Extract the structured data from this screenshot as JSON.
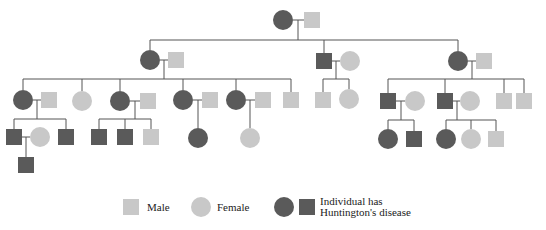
{
  "colors": {
    "affected": "#5a5a5a",
    "unaffected": "#c8c8c8",
    "line": "#555555",
    "background": "#ffffff"
  },
  "legend": {
    "male_label": "Male",
    "female_label": "Female",
    "affected_label_line1": "Individual has",
    "affected_label_line2": "Huntington's disease"
  },
  "individuals": [
    {
      "id": "g1-f",
      "gen": 1,
      "sex": "female",
      "affected": true,
      "x": 283,
      "y": 20
    },
    {
      "id": "g1-m",
      "gen": 1,
      "sex": "male",
      "affected": false,
      "x": 312,
      "y": 20
    },
    {
      "id": "g2-f1",
      "gen": 2,
      "sex": "female",
      "affected": true,
      "x": 150,
      "y": 60
    },
    {
      "id": "g2-m1",
      "gen": 2,
      "sex": "male",
      "affected": false,
      "x": 176,
      "y": 60
    },
    {
      "id": "g2-m2",
      "gen": 2,
      "sex": "male",
      "affected": true,
      "x": 324,
      "y": 61
    },
    {
      "id": "g2-f2",
      "gen": 2,
      "sex": "female",
      "affected": false,
      "x": 350,
      "y": 61
    },
    {
      "id": "g2-f3",
      "gen": 2,
      "sex": "female",
      "affected": true,
      "x": 458,
      "y": 61
    },
    {
      "id": "g2-m3",
      "gen": 2,
      "sex": "male",
      "affected": false,
      "x": 484,
      "y": 61
    },
    {
      "id": "g3-f1",
      "gen": 3,
      "sex": "female",
      "affected": true,
      "x": 23,
      "y": 100
    },
    {
      "id": "g3-m1",
      "gen": 3,
      "sex": "male",
      "affected": false,
      "x": 49,
      "y": 100
    },
    {
      "id": "g3-f2",
      "gen": 3,
      "sex": "female",
      "affected": false,
      "x": 82,
      "y": 101
    },
    {
      "id": "g3-f3",
      "gen": 3,
      "sex": "female",
      "affected": true,
      "x": 120,
      "y": 101
    },
    {
      "id": "g3-m3",
      "gen": 3,
      "sex": "male",
      "affected": false,
      "x": 148,
      "y": 101
    },
    {
      "id": "g3-f4",
      "gen": 3,
      "sex": "female",
      "affected": true,
      "x": 183,
      "y": 100
    },
    {
      "id": "g3-m4",
      "gen": 3,
      "sex": "male",
      "affected": false,
      "x": 210,
      "y": 100
    },
    {
      "id": "g3-f5",
      "gen": 3,
      "sex": "female",
      "affected": true,
      "x": 236,
      "y": 100
    },
    {
      "id": "g3-m5",
      "gen": 3,
      "sex": "male",
      "affected": false,
      "x": 263,
      "y": 100
    },
    {
      "id": "g3-m6",
      "gen": 3,
      "sex": "male",
      "affected": false,
      "x": 291,
      "y": 100
    },
    {
      "id": "g3-m7",
      "gen": 3,
      "sex": "male",
      "affected": false,
      "x": 323,
      "y": 100
    },
    {
      "id": "g3-f7",
      "gen": 3,
      "sex": "female",
      "affected": false,
      "x": 349,
      "y": 99
    },
    {
      "id": "g3-m8",
      "gen": 3,
      "sex": "male",
      "affected": true,
      "x": 388,
      "y": 101
    },
    {
      "id": "g3-f8",
      "gen": 3,
      "sex": "female",
      "affected": false,
      "x": 415,
      "y": 101
    },
    {
      "id": "g3-m9",
      "gen": 3,
      "sex": "male",
      "affected": true,
      "x": 445,
      "y": 101
    },
    {
      "id": "g3-f9",
      "gen": 3,
      "sex": "female",
      "affected": false,
      "x": 470,
      "y": 101
    },
    {
      "id": "g3-m10",
      "gen": 3,
      "sex": "male",
      "affected": false,
      "x": 504,
      "y": 101
    },
    {
      "id": "g3-m11",
      "gen": 3,
      "sex": "male",
      "affected": false,
      "x": 524,
      "y": 101
    },
    {
      "id": "g4-m1",
      "gen": 4,
      "sex": "male",
      "affected": true,
      "x": 14,
      "y": 137
    },
    {
      "id": "g4-f1",
      "gen": 4,
      "sex": "female",
      "affected": false,
      "x": 40,
      "y": 137
    },
    {
      "id": "g4-m2",
      "gen": 4,
      "sex": "male",
      "affected": true,
      "x": 66,
      "y": 137
    },
    {
      "id": "g4-m3",
      "gen": 4,
      "sex": "male",
      "affected": true,
      "x": 99,
      "y": 137
    },
    {
      "id": "g4-m4",
      "gen": 4,
      "sex": "male",
      "affected": true,
      "x": 125,
      "y": 137
    },
    {
      "id": "g4-m5",
      "gen": 4,
      "sex": "male",
      "affected": false,
      "x": 151,
      "y": 137
    },
    {
      "id": "g4-f6",
      "gen": 4,
      "sex": "female",
      "affected": true,
      "x": 198,
      "y": 138
    },
    {
      "id": "g4-f7",
      "gen": 4,
      "sex": "female",
      "affected": false,
      "x": 250,
      "y": 138
    },
    {
      "id": "g4-f8",
      "gen": 4,
      "sex": "female",
      "affected": true,
      "x": 388,
      "y": 139
    },
    {
      "id": "g4-m8",
      "gen": 4,
      "sex": "male",
      "affected": true,
      "x": 414,
      "y": 139
    },
    {
      "id": "g4-f9",
      "gen": 4,
      "sex": "female",
      "affected": true,
      "x": 446,
      "y": 139
    },
    {
      "id": "g4-f10",
      "gen": 4,
      "sex": "female",
      "affected": false,
      "x": 471,
      "y": 139
    },
    {
      "id": "g4-m10",
      "gen": 4,
      "sex": "male",
      "affected": false,
      "x": 496,
      "y": 139
    },
    {
      "id": "g5-m1",
      "gen": 5,
      "sex": "male",
      "affected": true,
      "x": 26,
      "y": 165
    }
  ],
  "lines": [
    [
      293,
      20,
      304,
      20
    ],
    [
      298,
      20,
      298,
      40
    ],
    [
      150,
      40,
      458,
      40
    ],
    [
      150,
      40,
      150,
      50
    ],
    [
      324,
      40,
      324,
      53
    ],
    [
      458,
      40,
      458,
      51
    ],
    [
      160,
      60,
      168,
      60
    ],
    [
      164,
      60,
      164,
      79
    ],
    [
      23,
      79,
      291,
      79
    ],
    [
      23,
      79,
      23,
      90
    ],
    [
      82,
      79,
      82,
      91
    ],
    [
      120,
      79,
      120,
      91
    ],
    [
      183,
      79,
      183,
      90
    ],
    [
      236,
      79,
      236,
      90
    ],
    [
      291,
      79,
      291,
      92
    ],
    [
      332,
      61,
      340,
      61
    ],
    [
      336,
      61,
      336,
      79
    ],
    [
      323,
      79,
      349,
      79
    ],
    [
      323,
      79,
      323,
      92
    ],
    [
      349,
      79,
      349,
      89
    ],
    [
      468,
      61,
      476,
      61
    ],
    [
      472,
      61,
      472,
      79
    ],
    [
      388,
      79,
      524,
      79
    ],
    [
      388,
      79,
      388,
      93
    ],
    [
      445,
      79,
      445,
      93
    ],
    [
      504,
      79,
      504,
      93
    ],
    [
      524,
      79,
      524,
      93
    ],
    [
      33,
      100,
      41,
      100
    ],
    [
      37,
      100,
      37,
      119
    ],
    [
      14,
      119,
      66,
      119
    ],
    [
      14,
      119,
      14,
      129
    ],
    [
      66,
      119,
      66,
      129
    ],
    [
      130,
      101,
      140,
      101
    ],
    [
      135,
      101,
      135,
      119
    ],
    [
      99,
      119,
      151,
      119
    ],
    [
      99,
      119,
      99,
      129
    ],
    [
      125,
      119,
      125,
      129
    ],
    [
      151,
      119,
      151,
      129
    ],
    [
      193,
      100,
      202,
      100
    ],
    [
      198,
      100,
      198,
      128
    ],
    [
      246,
      100,
      255,
      100
    ],
    [
      250,
      100,
      250,
      128
    ],
    [
      396,
      101,
      405,
      101
    ],
    [
      401,
      101,
      401,
      120
    ],
    [
      388,
      120,
      414,
      120
    ],
    [
      388,
      120,
      388,
      129
    ],
    [
      414,
      120,
      414,
      131
    ],
    [
      453,
      101,
      460,
      101
    ],
    [
      457,
      101,
      457,
      120
    ],
    [
      446,
      120,
      496,
      120
    ],
    [
      446,
      120,
      446,
      129
    ],
    [
      471,
      120,
      471,
      129
    ],
    [
      496,
      120,
      496,
      131
    ],
    [
      22,
      137,
      30,
      137
    ],
    [
      26,
      137,
      26,
      157
    ]
  ],
  "legend_symbols": [
    {
      "kind": "male",
      "affected": false,
      "x": 131,
      "y": 207
    },
    {
      "kind": "female",
      "affected": false,
      "x": 201,
      "y": 207
    },
    {
      "kind": "female",
      "affected": true,
      "x": 284,
      "y": 207
    },
    {
      "kind": "male",
      "affected": true,
      "x": 307,
      "y": 207
    }
  ]
}
